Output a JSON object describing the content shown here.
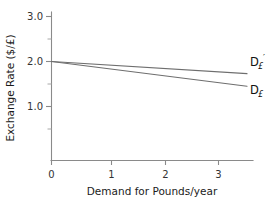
{
  "chart_data": {
    "type": "line",
    "title": "",
    "xlabel": "Demand for Pounds/year",
    "ylabel": "Exchange Rate ($/£)",
    "xlim": [
      0,
      3.7
    ],
    "ylim": [
      -0.2,
      3.1
    ],
    "grid": false,
    "legend_position": "right-inline",
    "xticks": [
      0,
      1,
      2,
      3
    ],
    "xtick_labels": [
      "0",
      "1",
      "2",
      "3"
    ],
    "yticks": [
      1.0,
      2.0,
      3.0
    ],
    "ytick_labels": [
      "1.0",
      "2.0",
      "3.0"
    ],
    "yticks_minor": [
      0.5,
      1.5,
      2.5
    ],
    "series": [
      {
        "name": "D£'",
        "label_base": "D",
        "label_sub": "£",
        "label_prime": "′",
        "color": "#6e6e6e",
        "x": [
          0,
          3.68
        ],
        "values": [
          2.0,
          1.73
        ]
      },
      {
        "name": "D£",
        "label_base": "D",
        "label_sub": "£",
        "label_prime": "",
        "color": "#6e6e6e",
        "x": [
          0,
          3.68
        ],
        "values": [
          2.0,
          1.45
        ]
      }
    ]
  },
  "figure": {
    "background_color": "#ffffff",
    "axis_color": "#8a8a8a",
    "text_color": "#1b1b1b"
  }
}
